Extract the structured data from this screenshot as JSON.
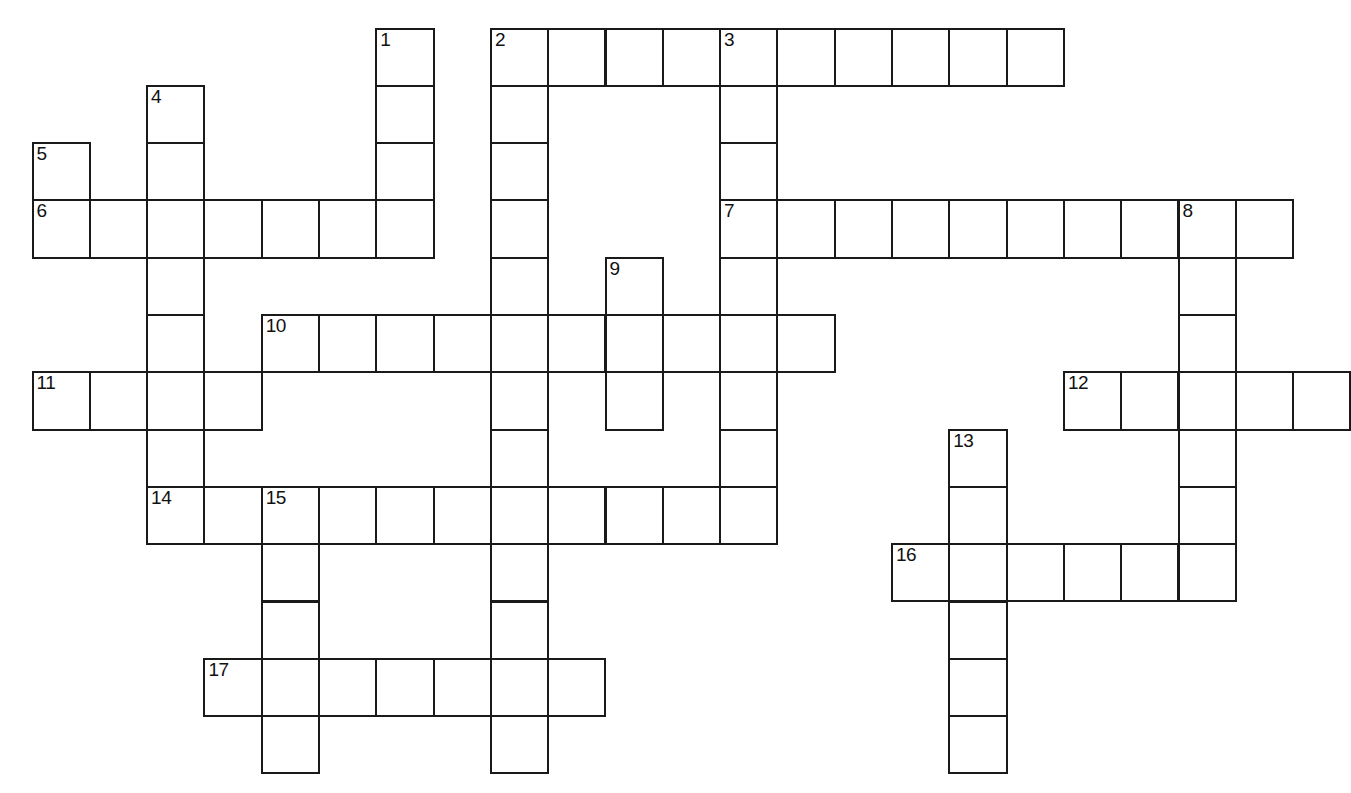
{
  "puzzle": {
    "title": "Crossword Puzzle Grid",
    "type": "crossword-grid",
    "cell_size": 57.3,
    "origin_x": 31.5,
    "origin_y": 27.5,
    "grid_columns": 23,
    "grid_rows": 14,
    "colors": {
      "background": "#ffffff",
      "cell_fill": "#ffffff",
      "border": "#1a1a1a",
      "number_text": "#111111"
    },
    "clue_numbers": [
      {
        "n": "1",
        "col": 6,
        "row": 0
      },
      {
        "n": "2",
        "col": 8,
        "row": 0
      },
      {
        "n": "3",
        "col": 12,
        "row": 0
      },
      {
        "n": "4",
        "col": 2,
        "row": 1
      },
      {
        "n": "5",
        "col": 0,
        "row": 2
      },
      {
        "n": "6",
        "col": 0,
        "row": 3
      },
      {
        "n": "7",
        "col": 12,
        "row": 3
      },
      {
        "n": "8",
        "col": 20,
        "row": 3
      },
      {
        "n": "9",
        "col": 10,
        "row": 4
      },
      {
        "n": "10",
        "col": 4,
        "row": 5
      },
      {
        "n": "11",
        "col": 0,
        "row": 6
      },
      {
        "n": "12",
        "col": 18,
        "row": 6
      },
      {
        "n": "13",
        "col": 16,
        "row": 7
      },
      {
        "n": "14",
        "col": 2,
        "row": 8
      },
      {
        "n": "15",
        "col": 4,
        "row": 8
      },
      {
        "n": "16",
        "col": 15,
        "row": 9
      },
      {
        "n": "17",
        "col": 3,
        "row": 11
      }
    ],
    "entries": {
      "across": [
        {
          "number": "2",
          "col": 8,
          "row": 0,
          "length": 9
        },
        {
          "number": "6",
          "col": 0,
          "row": 3,
          "length": 7
        },
        {
          "number": "7",
          "col": 12,
          "row": 3,
          "length": 10
        },
        {
          "number": "10",
          "col": 4,
          "row": 5,
          "length": 10
        },
        {
          "number": "11",
          "col": 0,
          "row": 6,
          "length": 4
        },
        {
          "number": "12",
          "col": 18,
          "row": 6,
          "length": 5
        },
        {
          "number": "14",
          "col": 2,
          "row": 8,
          "length": 11
        },
        {
          "number": "16",
          "col": 15,
          "row": 9,
          "length": 6
        },
        {
          "number": "17",
          "col": 3,
          "row": 11,
          "length": 7
        }
      ],
      "down": [
        {
          "number": "1",
          "col": 6,
          "row": 0,
          "length": 4
        },
        {
          "number": "2",
          "col": 8,
          "row": 0,
          "length": 13
        },
        {
          "number": "3",
          "col": 12,
          "row": 0,
          "length": 9
        },
        {
          "number": "4",
          "col": 2,
          "row": 1,
          "length": 8
        },
        {
          "number": "5",
          "col": 0,
          "row": 2,
          "length": 2
        },
        {
          "number": "8",
          "col": 20,
          "row": 3,
          "length": 7
        },
        {
          "number": "9",
          "col": 10,
          "row": 4,
          "length": 3
        },
        {
          "number": "13",
          "col": 16,
          "row": 7,
          "length": 7
        },
        {
          "number": "15",
          "col": 4,
          "row": 8,
          "length": 6
        }
      ]
    },
    "cells": [
      {
        "col": 6,
        "row": 0,
        "num": "1"
      },
      {
        "col": 6,
        "row": 1
      },
      {
        "col": 6,
        "row": 2
      },
      {
        "col": 8,
        "row": 0,
        "num": "2"
      },
      {
        "col": 9,
        "row": 0
      },
      {
        "col": 10,
        "row": 0
      },
      {
        "col": 11,
        "row": 0
      },
      {
        "col": 12,
        "row": 0,
        "num": "3"
      },
      {
        "col": 13,
        "row": 0
      },
      {
        "col": 14,
        "row": 0
      },
      {
        "col": 15,
        "row": 0
      },
      {
        "col": 16,
        "row": 0
      },
      {
        "col": 17,
        "row": 0
      },
      {
        "col": 2,
        "row": 1,
        "num": "4"
      },
      {
        "col": 8,
        "row": 1
      },
      {
        "col": 12,
        "row": 1
      },
      {
        "col": 0,
        "row": 2,
        "num": "5"
      },
      {
        "col": 2,
        "row": 2
      },
      {
        "col": 6,
        "row": 2,
        "dup": true
      },
      {
        "col": 8,
        "row": 2
      },
      {
        "col": 12,
        "row": 2
      },
      {
        "col": 0,
        "row": 3,
        "num": "6"
      },
      {
        "col": 1,
        "row": 3
      },
      {
        "col": 2,
        "row": 3
      },
      {
        "col": 3,
        "row": 3
      },
      {
        "col": 4,
        "row": 3
      },
      {
        "col": 5,
        "row": 3
      },
      {
        "col": 6,
        "row": 3
      },
      {
        "col": 8,
        "row": 3
      },
      {
        "col": 12,
        "row": 3,
        "num": "7"
      },
      {
        "col": 13,
        "row": 3
      },
      {
        "col": 14,
        "row": 3
      },
      {
        "col": 15,
        "row": 3
      },
      {
        "col": 16,
        "row": 3
      },
      {
        "col": 17,
        "row": 3
      },
      {
        "col": 18,
        "row": 3
      },
      {
        "col": 19,
        "row": 3
      },
      {
        "col": 20,
        "row": 3,
        "num": "8"
      },
      {
        "col": 21,
        "row": 3
      },
      {
        "col": 2,
        "row": 4
      },
      {
        "col": 8,
        "row": 4
      },
      {
        "col": 10,
        "row": 4,
        "num": "9"
      },
      {
        "col": 12,
        "row": 4
      },
      {
        "col": 20,
        "row": 4
      },
      {
        "col": 2,
        "row": 5
      },
      {
        "col": 4,
        "row": 5,
        "num": "10"
      },
      {
        "col": 5,
        "row": 5
      },
      {
        "col": 6,
        "row": 5
      },
      {
        "col": 7,
        "row": 5
      },
      {
        "col": 8,
        "row": 5
      },
      {
        "col": 9,
        "row": 5
      },
      {
        "col": 10,
        "row": 5
      },
      {
        "col": 11,
        "row": 5
      },
      {
        "col": 12,
        "row": 5
      },
      {
        "col": 13,
        "row": 5
      },
      {
        "col": 20,
        "row": 5
      },
      {
        "col": 0,
        "row": 6,
        "num": "11"
      },
      {
        "col": 1,
        "row": 6
      },
      {
        "col": 2,
        "row": 6
      },
      {
        "col": 3,
        "row": 6
      },
      {
        "col": 8,
        "row": 6
      },
      {
        "col": 10,
        "row": 6
      },
      {
        "col": 12,
        "row": 6
      },
      {
        "col": 18,
        "row": 6,
        "num": "12"
      },
      {
        "col": 19,
        "row": 6
      },
      {
        "col": 20,
        "row": 6
      },
      {
        "col": 21,
        "row": 6
      },
      {
        "col": 22,
        "row": 6
      },
      {
        "col": 2,
        "row": 7
      },
      {
        "col": 8,
        "row": 7
      },
      {
        "col": 12,
        "row": 7
      },
      {
        "col": 16,
        "row": 7,
        "num": "13"
      },
      {
        "col": 20,
        "row": 7
      },
      {
        "col": 2,
        "row": 8,
        "num": "14"
      },
      {
        "col": 3,
        "row": 8
      },
      {
        "col": 4,
        "row": 8,
        "num": "15"
      },
      {
        "col": 5,
        "row": 8
      },
      {
        "col": 6,
        "row": 8
      },
      {
        "col": 7,
        "row": 8
      },
      {
        "col": 8,
        "row": 8
      },
      {
        "col": 9,
        "row": 8
      },
      {
        "col": 10,
        "row": 8
      },
      {
        "col": 11,
        "row": 8
      },
      {
        "col": 12,
        "row": 8
      },
      {
        "col": 16,
        "row": 8
      },
      {
        "col": 20,
        "row": 8
      },
      {
        "col": 4,
        "row": 9
      },
      {
        "col": 8,
        "row": 9
      },
      {
        "col": 15,
        "row": 9,
        "num": "16"
      },
      {
        "col": 16,
        "row": 9
      },
      {
        "col": 17,
        "row": 9
      },
      {
        "col": 18,
        "row": 9
      },
      {
        "col": 19,
        "row": 9
      },
      {
        "col": 20,
        "row": 9
      },
      {
        "col": 4,
        "row": 10
      },
      {
        "col": 8,
        "row": 10
      },
      {
        "col": 16,
        "row": 10
      },
      {
        "col": 3,
        "row": 11,
        "num": "17"
      },
      {
        "col": 4,
        "row": 11
      },
      {
        "col": 5,
        "row": 11
      },
      {
        "col": 6,
        "row": 11
      },
      {
        "col": 7,
        "row": 11
      },
      {
        "col": 8,
        "row": 11
      },
      {
        "col": 9,
        "row": 11
      },
      {
        "col": 16,
        "row": 11
      },
      {
        "col": 4,
        "row": 12
      },
      {
        "col": 8,
        "row": 12
      },
      {
        "col": 16,
        "row": 12
      }
    ]
  }
}
